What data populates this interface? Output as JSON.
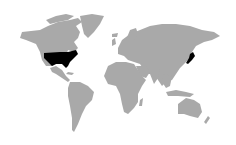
{
  "map": {
    "type": "world choropleth",
    "background_color": "#ffffff",
    "land_color": "#a9a9a9",
    "highlight_color": "#000000",
    "highlighted_countries": [
      "United States",
      "Japan"
    ]
  }
}
